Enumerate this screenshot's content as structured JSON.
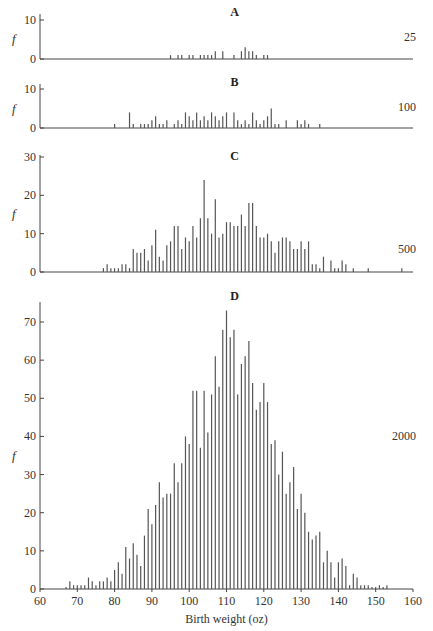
{
  "chart_data": [
    {
      "type": "bar",
      "title": "A",
      "n_label": "25",
      "ylabel": "f",
      "xlabel": "",
      "ylim": [
        0,
        10
      ],
      "yticks": [
        0,
        10
      ],
      "xlim": [
        60,
        160
      ],
      "x": [
        95,
        97,
        98,
        100,
        101,
        103,
        104,
        105,
        106,
        107,
        109,
        112,
        114,
        115,
        116,
        117,
        118,
        120,
        121
      ],
      "values": [
        1,
        1,
        1,
        1,
        1,
        1,
        1,
        1,
        1,
        2,
        2,
        1,
        2,
        3,
        2,
        2,
        1,
        1,
        1
      ]
    },
    {
      "type": "bar",
      "title": "B",
      "n_label": "100",
      "ylabel": "f",
      "xlabel": "",
      "ylim": [
        0,
        10
      ],
      "yticks": [
        0,
        10
      ],
      "xlim": [
        60,
        160
      ],
      "x": [
        80,
        84,
        85,
        87,
        88,
        89,
        90,
        91,
        92,
        93,
        94,
        96,
        97,
        98,
        99,
        100,
        101,
        102,
        103,
        104,
        105,
        106,
        107,
        108,
        109,
        110,
        112,
        113,
        114,
        115,
        116,
        117,
        118,
        119,
        120,
        121,
        122,
        123,
        124,
        126,
        129,
        130,
        131,
        132,
        135
      ],
      "values": [
        1,
        4,
        1,
        1,
        1,
        1,
        2,
        3,
        1,
        1,
        2,
        1,
        2,
        1,
        4,
        3,
        2,
        4,
        2,
        3,
        2,
        4,
        3,
        2,
        3,
        4,
        4,
        2,
        1,
        2,
        1,
        4,
        2,
        1,
        2,
        3,
        5,
        1,
        1,
        2,
        2,
        1,
        2,
        1,
        1
      ]
    },
    {
      "type": "bar",
      "title": "C",
      "n_label": "500",
      "ylabel": "f",
      "xlabel": "",
      "ylim": [
        0,
        30
      ],
      "yticks": [
        0,
        10,
        20,
        30
      ],
      "xlim": [
        60,
        160
      ],
      "x": [
        77,
        78,
        79,
        80,
        81,
        82,
        83,
        84,
        85,
        86,
        87,
        88,
        89,
        90,
        91,
        92,
        93,
        94,
        95,
        96,
        97,
        98,
        99,
        100,
        101,
        102,
        103,
        104,
        105,
        106,
        107,
        108,
        109,
        110,
        111,
        112,
        113,
        114,
        115,
        116,
        117,
        118,
        119,
        120,
        121,
        122,
        123,
        124,
        125,
        126,
        127,
        128,
        129,
        130,
        131,
        132,
        133,
        134,
        135,
        136,
        138,
        139,
        140,
        141,
        142,
        144,
        148,
        157
      ],
      "values": [
        1,
        2,
        1,
        1,
        1,
        2,
        2,
        1,
        6,
        5,
        5,
        6,
        3,
        7,
        11,
        4,
        3,
        7,
        8,
        12,
        12,
        6,
        9,
        8,
        12,
        9,
        14,
        24,
        14,
        10,
        19,
        9,
        10,
        13,
        13,
        12,
        12,
        15,
        12,
        18,
        18,
        12,
        9,
        9,
        10,
        8,
        5,
        8,
        9,
        9,
        8,
        6,
        6,
        8,
        6,
        8,
        2,
        2,
        1,
        4,
        3,
        1,
        1,
        3,
        2,
        1,
        1,
        1
      ]
    },
    {
      "type": "bar",
      "title": "D",
      "n_label": "2000",
      "ylabel": "f",
      "xlabel": "Birth weight (oz)",
      "ylim": [
        0,
        75
      ],
      "yticks": [
        0,
        10,
        20,
        30,
        40,
        50,
        60,
        70
      ],
      "xlim": [
        60,
        160
      ],
      "xticks": [
        60,
        70,
        80,
        90,
        100,
        110,
        120,
        130,
        140,
        150,
        160
      ],
      "x": [
        67,
        68,
        69,
        70,
        71,
        72,
        73,
        74,
        75,
        76,
        77,
        78,
        79,
        80,
        81,
        82,
        83,
        84,
        85,
        86,
        87,
        88,
        89,
        90,
        91,
        92,
        93,
        94,
        95,
        96,
        97,
        98,
        99,
        100,
        101,
        102,
        103,
        104,
        105,
        106,
        107,
        108,
        109,
        110,
        111,
        112,
        113,
        114,
        115,
        116,
        117,
        118,
        119,
        120,
        121,
        122,
        123,
        124,
        125,
        126,
        127,
        128,
        129,
        130,
        131,
        132,
        133,
        134,
        135,
        136,
        137,
        138,
        139,
        140,
        141,
        142,
        143,
        144,
        145,
        146,
        147,
        148,
        149,
        150,
        151,
        152,
        153
      ],
      "values": [
        0.5,
        2,
        1,
        1,
        1,
        1,
        3,
        2,
        1,
        2,
        2,
        3,
        2,
        5,
        7,
        4,
        11,
        8,
        12,
        9,
        6,
        14,
        21,
        17,
        22,
        28,
        24,
        25,
        25,
        33,
        28,
        33,
        40,
        38,
        52,
        52,
        37,
        52,
        41,
        51,
        61,
        53,
        68,
        73,
        66,
        68,
        51,
        59,
        61,
        65,
        54,
        47,
        49,
        54,
        49,
        38,
        39,
        30,
        36,
        25,
        28,
        32,
        21,
        25,
        20,
        15,
        13,
        14,
        15,
        7,
        10,
        7,
        3,
        7,
        8,
        6,
        1,
        4,
        3,
        1,
        1,
        1,
        0.5,
        0.5,
        1,
        0.5,
        1
      ]
    }
  ]
}
